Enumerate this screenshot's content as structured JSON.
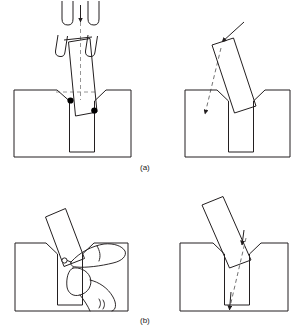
{
  "figure": {
    "domain_note": "four-panel line drawing",
    "background_color": "#ffffff",
    "line_color": "#231f20",
    "dash_color": "#6b6b6b",
    "marker_color": "#000000"
  },
  "captions": {
    "a": "(a)",
    "b": "(b)"
  },
  "panels": [
    {
      "id": "panel-top-left",
      "caption_ref": "a",
      "position": "top-left",
      "description": "Robot gripper fingers lowering a tilted peg into a chamfered hole; two contact points marked with filled dots",
      "elements": [
        "gripper-open-upper",
        "gripper-tilted-lower",
        "insertion-arrow-down",
        "centerline-dashed",
        "peg-tilted",
        "workpiece-block",
        "chamfered-hole",
        "contact-point-left",
        "contact-point-right"
      ]
    },
    {
      "id": "panel-top-right",
      "caption_ref": "a",
      "position": "top-right",
      "description": "Tilted peg seated against chamfer; solid force arrow at peg top and dashed reaction arrow to lower left",
      "elements": [
        "peg-tilted",
        "workpiece-block",
        "chamfered-hole",
        "force-arrow-solid",
        "reaction-arrow-dashed"
      ]
    },
    {
      "id": "panel-bottom-left",
      "caption_ref": "b",
      "position": "bottom-left",
      "description": "Human hand pinching and guiding a tilted peg toward the chamfered hole of the workpiece block",
      "elements": [
        "peg-tilted",
        "workpiece-block",
        "chamfered-hole",
        "hand-thumb-and-finger",
        "contact-point"
      ]
    },
    {
      "id": "panel-bottom-right",
      "caption_ref": "b",
      "position": "bottom-right",
      "description": "Peg entering the chamfered hole with a dashed insertion path showing two directional arrowheads",
      "elements": [
        "peg-tilted",
        "workpiece-block",
        "chamfered-hole",
        "insertion-path-dashed",
        "arrowhead-upper",
        "arrowhead-lower"
      ]
    }
  ]
}
